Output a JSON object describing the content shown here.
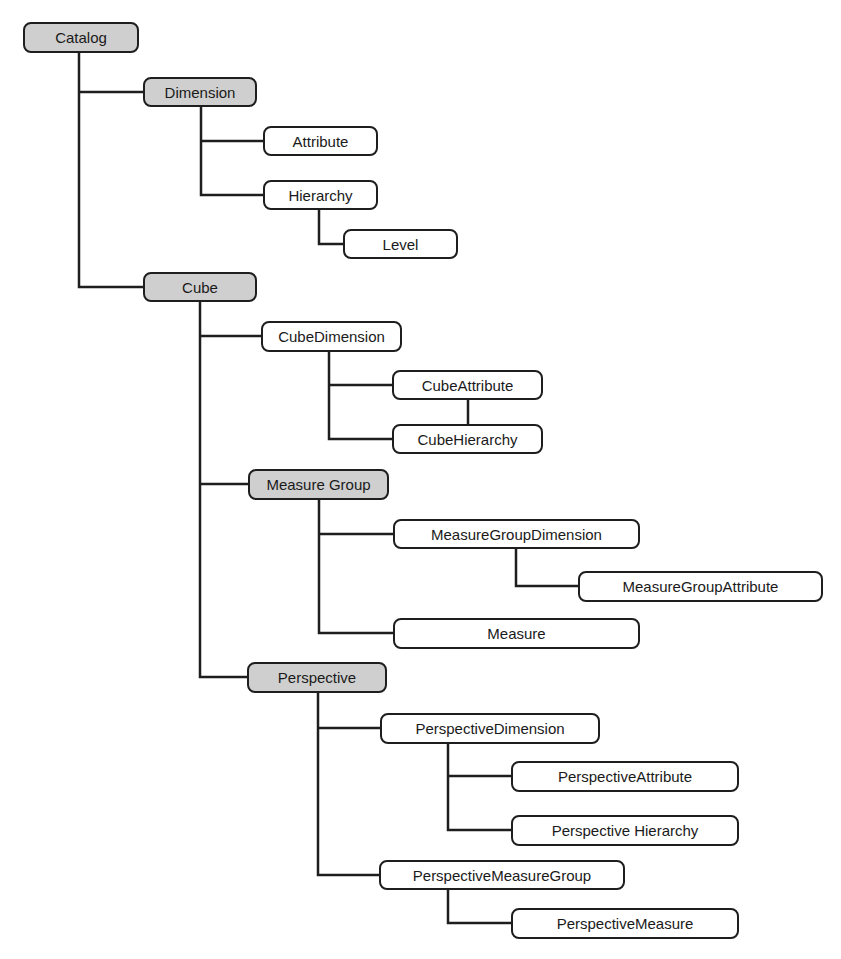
{
  "colors": {
    "group_fill": "#cfcfcf",
    "leaf_fill": "#ffffff",
    "stroke": "#1e1e1e",
    "text": "#1a1a1a"
  },
  "nodes": {
    "catalog": "Catalog",
    "dimension": "Dimension",
    "attribute": "Attribute",
    "hierarchy": "Hierarchy",
    "level": "Level",
    "cube": "Cube",
    "cube_dimension": "CubeDimension",
    "cube_attribute": "CubeAttribute",
    "cube_hierarchy": "CubeHierarchy",
    "measure_group": "Measure Group",
    "measure_group_dimension": "MeasureGroupDimension",
    "measure_group_attribute": "MeasureGroupAttribute",
    "measure": "Measure",
    "perspective": "Perspective",
    "perspective_dimension": "PerspectiveDimension",
    "perspective_attribute": "PerspectiveAttribute",
    "perspective_hierarchy": "Perspective Hierarchy",
    "perspective_measure_group": "PerspectiveMeasureGroup",
    "perspective_measure": "PerspectiveMeasure"
  },
  "tree": {
    "Catalog": {
      "Dimension": {
        "Attribute": {},
        "Hierarchy": {
          "Level": {}
        }
      },
      "Cube": {
        "CubeDimension": {
          "CubeAttribute": {},
          "CubeHierarchy": {}
        },
        "Measure Group": {
          "MeasureGroupDimension": {
            "MeasureGroupAttribute": {}
          },
          "Measure": {}
        },
        "Perspective": {
          "PerspectiveDimension": {
            "PerspectiveAttribute": {},
            "Perspective Hierarchy": {}
          },
          "PerspectiveMeasureGroup": {
            "PerspectiveMeasure": {}
          }
        }
      }
    }
  }
}
